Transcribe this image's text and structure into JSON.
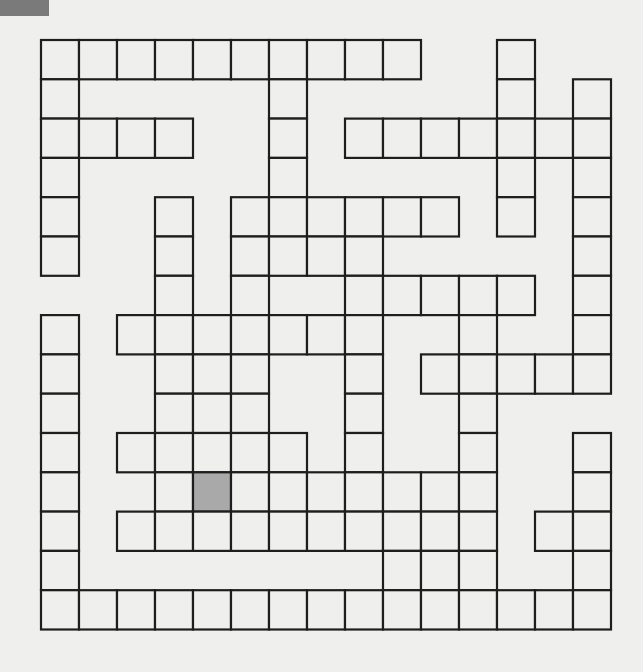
{
  "puzzle": {
    "type": "crossword-grid",
    "rows": 15,
    "cols": 15,
    "origin": {
      "x": 41,
      "y": 40
    },
    "cell_width": 38,
    "cell_height": 39.3,
    "line_color": "#1e1e1e",
    "cell_fill": "#efefed",
    "shaded_fill": "#a9a9a9",
    "corner_block_color": "#7a7a7a",
    "legend": {
      "#": "white cell",
      "S": "shaded cell",
      ".": "no cell"
    },
    "grid": [
      "##########..#..",
      "#.....#.....#.#",
      "####..#.#######",
      "#.....#.....#.#",
      "#..#.######.#.#",
      "#..#.####.....#",
      "...#.#..#####.#",
      "#.#######..#..#",
      "#..###..#.#####",
      "#..###..#..#...",
      "#.#####.#..#..#",
      "#..#S#######..#",
      "#.##########.##",
      "#........###..#",
      "###############"
    ]
  }
}
